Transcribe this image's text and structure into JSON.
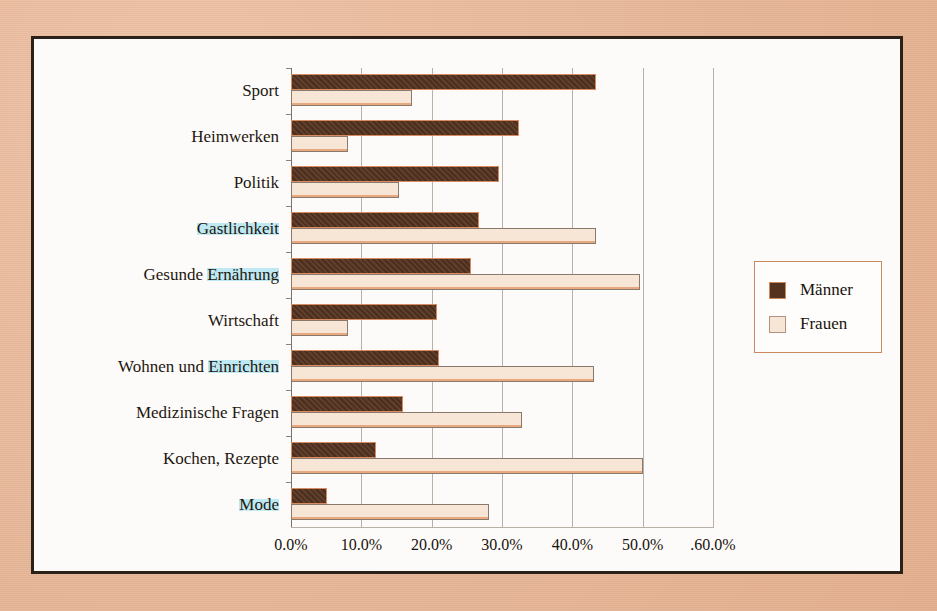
{
  "chart_data": {
    "type": "bar",
    "orientation": "horizontal",
    "title": "",
    "xlabel": "",
    "ylabel": "",
    "xlim": [
      0,
      60
    ],
    "xticks": [
      "0.0%",
      "10.0%",
      "20.0%",
      "30.0%",
      "40.0%",
      "50.0%",
      ".60.0%"
    ],
    "xtick_values": [
      0,
      10,
      20,
      30,
      40,
      50,
      60
    ],
    "grid": true,
    "legend_position": "right",
    "categories": [
      "Sport",
      "Heimwerken",
      "Politik",
      "Gastlichkeit",
      "Gesunde Ernährung",
      "Wirtschaft",
      "Wohnen und Einrichten",
      "Medizinische Fragen",
      "Kochen, Rezepte",
      "Mode"
    ],
    "series": [
      {
        "name": "Männer",
        "color": "#54321f",
        "values": [
          43.3,
          32.4,
          29.6,
          26.7,
          25.6,
          20.8,
          21.1,
          15.9,
          12.1,
          5.1
        ]
      },
      {
        "name": "Frauen",
        "color": "#f7e6d5",
        "values": [
          17.2,
          8.1,
          15.3,
          43.3,
          49.6,
          8.1,
          43.1,
          32.9,
          50.1,
          28.1
        ]
      }
    ],
    "highlighted_categories": [
      "Gastlichkeit",
      "Gesunde Ernährung",
      "Wohnen und Einrichten",
      "Mode"
    ],
    "highlight_color": "#bfe9f2"
  },
  "legend": {
    "entries": [
      {
        "label": "Männer"
      },
      {
        "label": "Frauen"
      }
    ]
  },
  "colors": {
    "page_background": "#e9bb9e",
    "chart_background": "#fdfbf9",
    "frame_border": "#2b2118",
    "bar_maenner": "#54321f",
    "bar_frauen": "#f7e6d5",
    "bar_outline": "#d98a5e",
    "gridline": "#b9b0a8",
    "highlight": "#bfe9f2"
  }
}
